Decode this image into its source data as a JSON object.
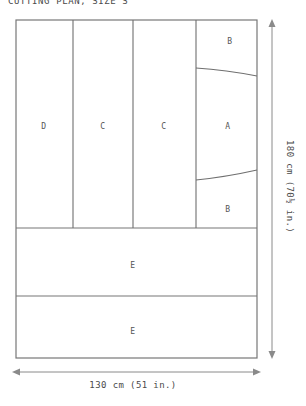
{
  "title": "CUTTING PLAN, SIZE S",
  "fabric": {
    "width_label": "130 cm (51 in.)",
    "height_label": "180 cm (70½ in.)",
    "outline_color": "#777777",
    "line_color": "#8a8a8a",
    "background_color": "#ffffff"
  },
  "pieces": [
    {
      "id": "piece-d",
      "label": "D",
      "cx": 44,
      "cy": 126
    },
    {
      "id": "piece-c-left",
      "label": "C",
      "cx": 103,
      "cy": 126
    },
    {
      "id": "piece-c-right",
      "label": "C",
      "cx": 164,
      "cy": 126
    },
    {
      "id": "piece-b-top",
      "label": "B",
      "cx": 230,
      "cy": 41
    },
    {
      "id": "piece-a",
      "label": "A",
      "cx": 228,
      "cy": 126
    },
    {
      "id": "piece-b-bottom",
      "label": "B",
      "cx": 228,
      "cy": 209
    },
    {
      "id": "piece-e-upper",
      "label": "E",
      "cx": 133,
      "cy": 265
    },
    {
      "id": "piece-e-lower",
      "label": "E",
      "cx": 133,
      "cy": 331
    }
  ],
  "dimensions": {
    "horizontal": {
      "name": "fabric-width",
      "value": "130 cm (51 in.)"
    },
    "vertical": {
      "name": "fabric-height",
      "value": "180 cm (70½ in.)"
    }
  }
}
